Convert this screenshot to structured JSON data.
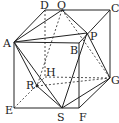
{
  "diagram": {
    "type": "cube-with-inscribed-octahedron",
    "vertices": {
      "A": {
        "label": "A",
        "x": 14,
        "y": 42
      },
      "B": {
        "label": "B",
        "x": 79,
        "y": 43
      },
      "C": {
        "label": "C",
        "x": 110,
        "y": 10
      },
      "D": {
        "label": "D",
        "x": 45,
        "y": 10
      },
      "E": {
        "label": "E",
        "x": 14,
        "y": 108
      },
      "F": {
        "label": "F",
        "x": 79,
        "y": 108
      },
      "G": {
        "label": "G",
        "x": 110,
        "y": 78
      },
      "H": {
        "label": "H",
        "x": 45,
        "y": 77
      },
      "P": {
        "label": "P",
        "x": 87,
        "y": 33
      },
      "Q": {
        "label": "Q",
        "x": 62,
        "y": 10
      },
      "R": {
        "label": "R",
        "x": 37,
        "y": 86
      },
      "S": {
        "label": "S",
        "x": 62,
        "y": 108
      }
    },
    "labels": [
      "A",
      "B",
      "C",
      "D",
      "E",
      "F",
      "G",
      "H",
      "P",
      "Q",
      "R",
      "S"
    ]
  }
}
